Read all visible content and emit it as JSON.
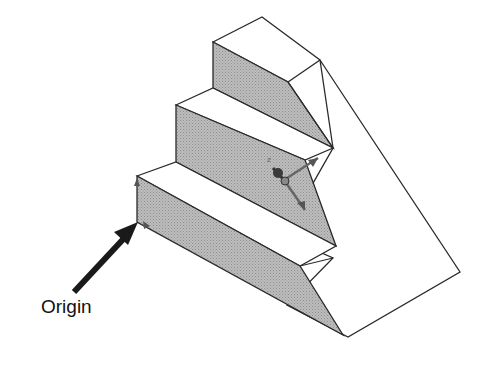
{
  "figure": {
    "annotation": {
      "label": "Origin",
      "arrow_target": "origin-point"
    },
    "triad_axes": [
      "Y",
      "Z",
      "X"
    ],
    "colors": {
      "shade": "#b0b0b0",
      "face": "#ffffff",
      "edge": "#2a2a2a",
      "arrow": "#1a1a1a",
      "triad": "#555555"
    }
  }
}
